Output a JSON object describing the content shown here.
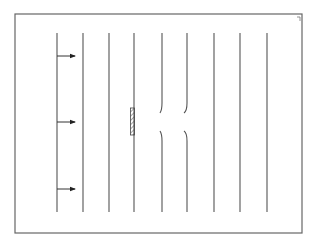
{
  "diagram": {
    "type": "streamline-flow-diagram",
    "frame": {
      "x": 15,
      "y": 14,
      "width": 287,
      "height": 219
    },
    "corner_mark": "tick-mark",
    "stroke_color": "#555555",
    "streamlines_x": [
      57,
      83,
      109,
      134,
      162,
      187,
      214,
      240,
      267
    ],
    "streamline_y_range": [
      33,
      212
    ],
    "arrows": [
      {
        "y": 56,
        "direction": "right"
      },
      {
        "y": 122,
        "direction": "right"
      },
      {
        "y": 189,
        "direction": "right"
      }
    ],
    "obstacle": {
      "x": 131,
      "y": 108,
      "width": 5,
      "height": 27,
      "fill": "hatched"
    },
    "deflected_lines": [
      {
        "index": 4,
        "bend_toward": "right"
      },
      {
        "index": 5,
        "bend_toward": "left"
      }
    ]
  }
}
